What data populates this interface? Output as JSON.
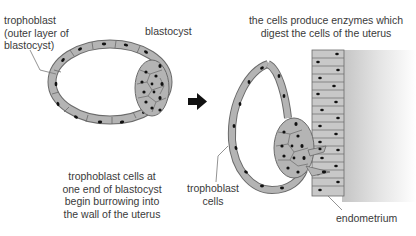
{
  "labels": {
    "trophoblast_outer": [
      "trophoblast",
      "(outer layer of",
      "blastocyst)"
    ],
    "blastocyst": "blastocyst",
    "caption_left": [
      "trophoblast cells at",
      "one end of blastocyst",
      "begin burrowing into",
      "the wall of the uterus"
    ],
    "caption_right_top": [
      "the cells produce enzymes which",
      "digest the cells of the uterus"
    ],
    "trophoblast_cells": [
      "trophoblast",
      "cells"
    ],
    "endometrium": "endometrium"
  },
  "icons": {
    "arrow": "right-arrow"
  },
  "colors": {
    "cell_fill": "#b4b4b4",
    "cell_stroke": "#6a6a6a",
    "nucleus": "#111111",
    "arrow": "#111111",
    "tissue_shadow": "#cfcfcf",
    "text": "#3a3a3a"
  }
}
